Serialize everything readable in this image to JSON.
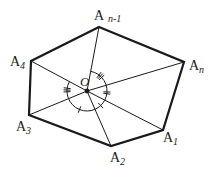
{
  "figure": {
    "center": {
      "name": "O",
      "label": "O"
    },
    "vertices": [
      {
        "id": "A_n-1",
        "letter": "A",
        "subscript": "n-1"
      },
      {
        "id": "A_n",
        "letter": "A",
        "subscript": "n"
      },
      {
        "id": "A_1",
        "letter": "A",
        "subscript": "1"
      },
      {
        "id": "A_2",
        "letter": "A",
        "subscript": "2"
      },
      {
        "id": "A_3",
        "letter": "A",
        "subscript": "3"
      },
      {
        "id": "A_4",
        "letter": "A",
        "subscript": "4"
      }
    ],
    "angle_marks": [
      {
        "between": [
          "A_n-1",
          "A_n"
        ],
        "ticks": 3
      },
      {
        "between": [
          "A_n",
          "A_1"
        ],
        "ticks": 2
      },
      {
        "between": [
          "A_2",
          "A_3"
        ],
        "ticks": 1
      },
      {
        "between": [
          "A_1",
          "A_2"
        ],
        "ticks": 1
      },
      {
        "between": [
          "A_3",
          "A_4"
        ],
        "ticks": 3
      }
    ],
    "colors": {
      "stroke": "#1a1a1a",
      "background": "#ffffff"
    }
  }
}
